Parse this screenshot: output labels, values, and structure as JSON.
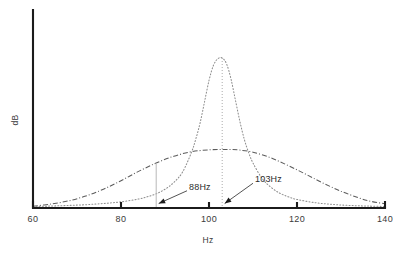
{
  "chart_data": {
    "type": "line",
    "title": "",
    "xlabel": "Hz",
    "ylabel": "dB",
    "xlim": [
      60,
      140
    ],
    "ylim": [
      0,
      1
    ],
    "grid": false,
    "legend": "none",
    "xticks": [
      {
        "value": 60,
        "label": "60"
      },
      {
        "value": 80,
        "label": "80"
      },
      {
        "value": 100,
        "label": "100"
      },
      {
        "value": 120,
        "label": "120"
      },
      {
        "value": 140,
        "label": "140"
      }
    ],
    "yticks": [],
    "series": [
      {
        "name": "narrow-resonance",
        "style": "dotted",
        "peak_x": 103,
        "peak_y": 1.0,
        "halfwidth": 4.2,
        "x": [
          60,
          64,
          68,
          72,
          76,
          80,
          84,
          86,
          88,
          90,
          92,
          94,
          96,
          97,
          98,
          99,
          100,
          101,
          102,
          103,
          104,
          105,
          106,
          107,
          108,
          109,
          110,
          112,
          114,
          116,
          118,
          120,
          124,
          128,
          132,
          136,
          140
        ],
        "y": [
          0.01,
          0.013,
          0.017,
          0.022,
          0.03,
          0.041,
          0.06,
          0.075,
          0.095,
          0.125,
          0.17,
          0.24,
          0.37,
          0.46,
          0.57,
          0.71,
          0.85,
          0.95,
          0.995,
          1.0,
          0.96,
          0.86,
          0.72,
          0.58,
          0.46,
          0.37,
          0.3,
          0.2,
          0.14,
          0.1,
          0.075,
          0.057,
          0.036,
          0.024,
          0.017,
          0.013,
          0.01
        ]
      },
      {
        "name": "broad-resonance",
        "style": "dash-dot",
        "peak_x": 105,
        "peak_y": 0.39,
        "halfwidth": 19,
        "x": [
          60,
          64,
          68,
          72,
          76,
          80,
          84,
          88,
          92,
          96,
          100,
          103,
          105,
          107,
          110,
          114,
          118,
          122,
          126,
          130,
          134,
          137,
          140
        ],
        "y": [
          0.012,
          0.026,
          0.047,
          0.08,
          0.125,
          0.182,
          0.244,
          0.3,
          0.345,
          0.375,
          0.388,
          0.39,
          0.39,
          0.386,
          0.372,
          0.335,
          0.283,
          0.225,
          0.165,
          0.112,
          0.068,
          0.043,
          0.028
        ]
      }
    ],
    "annotations": [
      {
        "id": "marker-88",
        "label": "88Hz",
        "target_x": 88,
        "target_y": 0,
        "label_x": 95,
        "label_y": 0.115,
        "guide": "vertical-line-at-88"
      },
      {
        "id": "marker-103",
        "label": "103Hz",
        "target_x": 103,
        "target_y": 0,
        "label_x": 110,
        "label_y": 0.165,
        "guide": "vertical-dotted-line-at-103"
      }
    ]
  },
  "axis": {
    "x_title": "Hz",
    "y_title": "dB"
  },
  "ticks": {
    "x0": "60",
    "x1": "80",
    "x2": "100",
    "x3": "120",
    "x4": "140"
  },
  "labels": {
    "anno_88": "88Hz",
    "anno_103": "103Hz"
  },
  "colors": {
    "axis": "#1b1b1b",
    "narrow_curve": "#8e8e8e",
    "broad_curve": "#5c5c5c",
    "guide": "#b9b9b9",
    "text": "#2b2b2b",
    "background": "#ffffff"
  }
}
